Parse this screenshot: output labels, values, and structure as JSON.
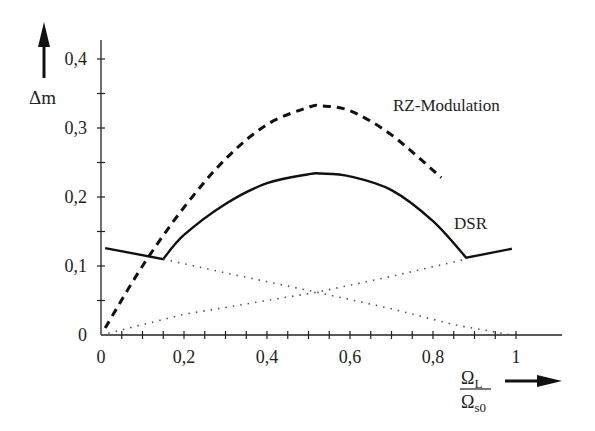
{
  "chart_data": {
    "type": "line",
    "title": "",
    "xlabel": "Ω_L / Ω_s0",
    "ylabel": "Δm",
    "xlim": [
      0,
      1.1
    ],
    "ylim": [
      0,
      0.43
    ],
    "grid": false,
    "legend_position": "inline annotations",
    "x_ticks": [
      "0",
      "0,2",
      "0,4",
      "0,6",
      "0,8",
      "1"
    ],
    "y_ticks": [
      "0",
      "0,1",
      "0,2",
      "0,3",
      "0,4"
    ],
    "series": [
      {
        "name": "RZ-Modulation",
        "style": "dashed",
        "x": [
          0.01,
          0.1,
          0.2,
          0.3,
          0.4,
          0.5,
          0.53,
          0.6,
          0.7,
          0.82
        ],
        "values": [
          0.01,
          0.1,
          0.185,
          0.255,
          0.305,
          0.33,
          0.332,
          0.325,
          0.29,
          0.228
        ]
      },
      {
        "name": "DSR",
        "style": "solid",
        "x": [
          0.01,
          0.15,
          0.2,
          0.3,
          0.4,
          0.5,
          0.53,
          0.6,
          0.7,
          0.8,
          0.88,
          0.99
        ],
        "values": [
          0.126,
          0.11,
          0.145,
          0.19,
          0.22,
          0.233,
          0.234,
          0.23,
          0.21,
          0.165,
          0.112,
          0.125
        ]
      },
      {
        "name": "dotted-rising",
        "style": "dotted",
        "x": [
          0.0,
          0.2,
          0.4,
          0.52,
          0.7,
          0.88
        ],
        "values": [
          0.0,
          0.03,
          0.05,
          0.062,
          0.085,
          0.11
        ]
      },
      {
        "name": "dotted-falling",
        "style": "dotted",
        "x": [
          0.15,
          0.3,
          0.52,
          0.7,
          0.85,
          0.99
        ],
        "values": [
          0.11,
          0.09,
          0.062,
          0.038,
          0.015,
          0.0
        ]
      }
    ],
    "annotations": [
      "RZ-Modulation",
      "DSR"
    ]
  },
  "labels": {
    "y_axis": "Δm",
    "x_num": "Ω",
    "x_num_sub": "L",
    "x_den": "Ω",
    "x_den_sub": "s0",
    "rz": "RZ-Modulation",
    "dsr": "DSR"
  }
}
